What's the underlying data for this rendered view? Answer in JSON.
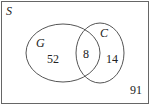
{
  "diagram": {
    "type": "venn",
    "universe_label": "S",
    "sets": [
      {
        "label": "G",
        "only_count": "52"
      },
      {
        "label": "C",
        "only_count": "14"
      }
    ],
    "intersection_count": "8",
    "outside_count": "91",
    "stroke_color": "#555555"
  }
}
